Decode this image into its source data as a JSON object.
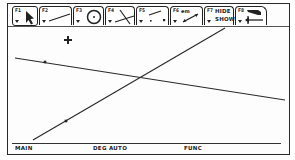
{
  "toolbar": {
    "tabs": [
      {
        "key": "F1",
        "icon": "pointer-arrow-icon",
        "active": true
      },
      {
        "key": "F2",
        "icon": "line-segment-icon",
        "active": false
      },
      {
        "key": "F3",
        "icon": "circle-icon",
        "active": false
      },
      {
        "key": "F4",
        "icon": "intersecting-lines-icon",
        "active": false
      },
      {
        "key": "F5",
        "icon": "point-on-line-icon",
        "active": false
      },
      {
        "key": "F6",
        "key_suffix": "em",
        "icon": "measure-icon",
        "active": false
      },
      {
        "key": "F7",
        "label_line1": "HIDE",
        "label_line2": "SHOW",
        "active": false
      },
      {
        "key": "F8",
        "icon": "eraser-back-icon",
        "active": false
      }
    ]
  },
  "drawing": {
    "cursor": {
      "icon": "crosshair-plus-icon",
      "x": 68,
      "y": 40
    },
    "lines": [
      {
        "name": "falling-line",
        "x1": 15,
        "y1": 58,
        "x2": 285,
        "y2": 100
      },
      {
        "name": "rising-line",
        "x1": 33,
        "y1": 140,
        "x2": 225,
        "y2": 28
      }
    ],
    "points": [
      {
        "name": "point-on-falling-line",
        "x": 45,
        "y": 62
      },
      {
        "name": "point-on-rising-line",
        "x": 66,
        "y": 121
      }
    ]
  },
  "statusbar": {
    "mode": "MAIN",
    "angle": "DEG AUTO",
    "graph": "FUNC"
  },
  "colors": {
    "ink": "#222222",
    "screen_bg": "#fdfdfd"
  }
}
